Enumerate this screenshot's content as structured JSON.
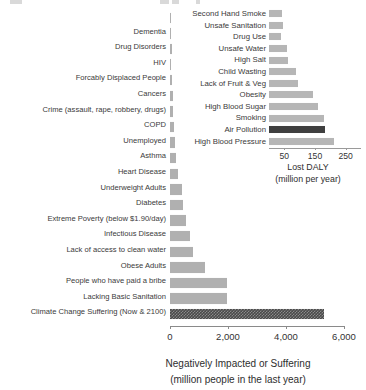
{
  "chart_data": [
    {
      "type": "bar",
      "orientation": "horizontal",
      "id": "main",
      "title": "",
      "xlabel": "Negatively Impacted or Suffering",
      "xlabel_sub": "(million people in the last year)",
      "ylabel": "",
      "xlim": [
        0,
        6000
      ],
      "xticks": [
        0,
        2000,
        4000,
        6000
      ],
      "xtick_labels": [
        "0",
        "2,000",
        "4,000",
        "6,000"
      ],
      "grid": false,
      "legend": "none",
      "bar_color": "#b0b0b0",
      "highlight_color": "#4a4a4a",
      "categories": [
        "",
        "Dementia",
        "Drug Disorders",
        "HIV",
        "Forcably Displaced People",
        "Cancers",
        "Crime (assault, rape, robbery, drugs)",
        "COPD",
        "Unemployed",
        "Asthma",
        "Heart Disease",
        "Underweight Adults",
        "Diabetes",
        "Extreme Poverty (below $1.90/day)",
        "Infectious Disease",
        "Lack of access to clean water",
        "Obese Adults",
        "People who have paid a bribe",
        "Lacking Basic Sanitation",
        "Climate Change Suffering (Now & 2100)"
      ],
      "values": [
        15,
        50,
        60,
        38,
        80,
        100,
        120,
        150,
        170,
        190,
        270,
        400,
        460,
        560,
        700,
        780,
        1200,
        1950,
        1950,
        5300
      ],
      "highlighted": [
        false,
        false,
        false,
        false,
        false,
        false,
        false,
        false,
        false,
        false,
        false,
        false,
        false,
        false,
        false,
        false,
        false,
        false,
        false,
        true
      ]
    },
    {
      "type": "bar",
      "orientation": "horizontal",
      "id": "inset",
      "title": "",
      "xlabel": "Lost DALY",
      "xlabel_sub": "(million per year)",
      "ylabel": "",
      "xlim": [
        0,
        300
      ],
      "xticks": [
        50,
        150,
        250
      ],
      "xtick_labels": [
        "50",
        "150",
        "250"
      ],
      "grid": false,
      "legend": "none",
      "bar_color": "#b6b6b6",
      "highlight_color": "#3f3f3f",
      "categories": [
        "Second Hand Smoke",
        "Unsafe Sanitation",
        "Drug Use",
        "Unsafe Water",
        "High Salt",
        "Child Wasting",
        "Lack of Fruit & Veg",
        "Obesity",
        "High Blood Sugar",
        "Smoking",
        "Air Pollution",
        "High Blood Pressure"
      ],
      "values": [
        42,
        45,
        40,
        58,
        62,
        88,
        93,
        145,
        160,
        180,
        184,
        212
      ],
      "highlighted": [
        false,
        false,
        false,
        false,
        false,
        false,
        false,
        false,
        false,
        false,
        true,
        false
      ]
    }
  ]
}
